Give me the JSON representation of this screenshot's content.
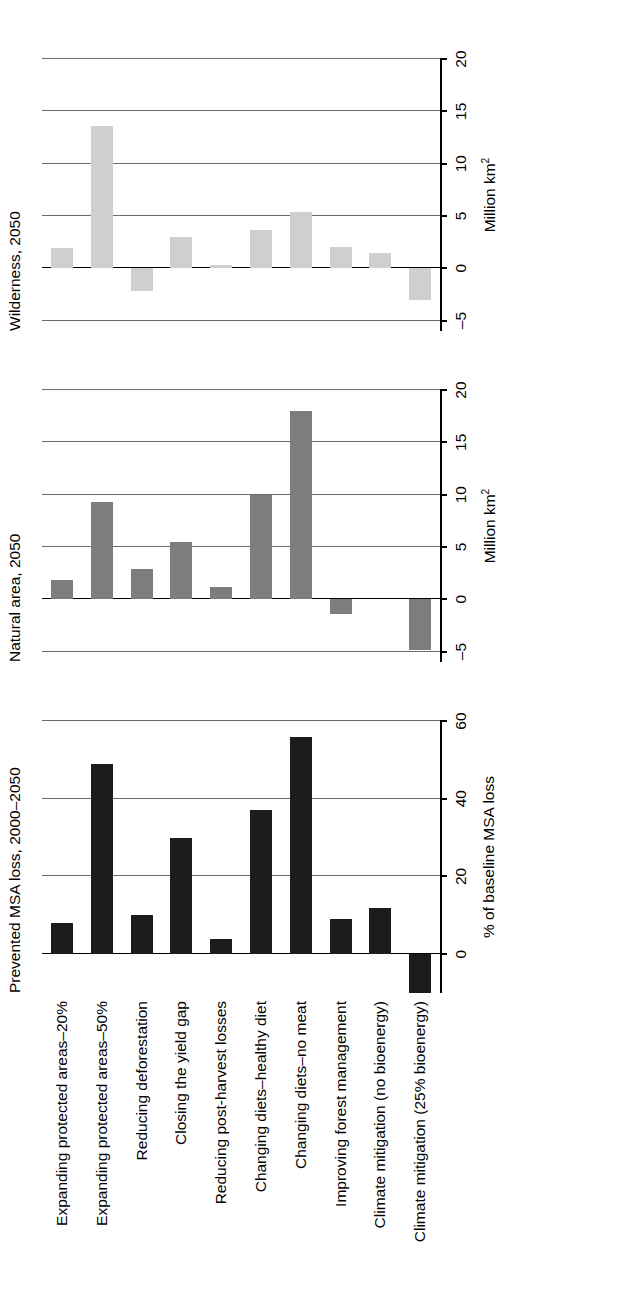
{
  "figure": {
    "categories": [
      "Expanding protected areas–20%",
      "Expanding protected areas–50%",
      "Reducing deforestation",
      "Closing the yield gap",
      "Reducing post-harvest losses",
      "Changing diets–healthy diet",
      "Changing diets–no meat",
      "Improving forest management",
      "Climate mitigation (no bioenergy)",
      "Climate mitigation (25% bioenergy)"
    ],
    "panels": [
      {
        "id": "prevented-msa-loss",
        "title": "Prevented MSA loss, 2000–2050",
        "axis_title": "% of baseline MSA loss",
        "axis_title_html": "% of baseline MSA loss",
        "ticks": [
          "0",
          "20",
          "40",
          "60"
        ],
        "tick_values": [
          0,
          20,
          40,
          60
        ],
        "axis_min": -10,
        "axis_max": 60,
        "bar_color": "#1c1c1c",
        "values": [
          8,
          49,
          10,
          30,
          4,
          37,
          56,
          9,
          12,
          -10
        ]
      },
      {
        "id": "natural-area",
        "title": "Natural area, 2050",
        "axis_title": "Million km2",
        "ticks": [
          "–5",
          "0",
          "5",
          "10",
          "15",
          "20"
        ],
        "tick_values": [
          -5,
          0,
          5,
          10,
          15,
          20
        ],
        "axis_min": -6,
        "axis_max": 20,
        "bar_color": "#7d7d7d",
        "values": [
          1.8,
          9.3,
          2.9,
          5.5,
          1.2,
          10.0,
          18.0,
          -1.4,
          0,
          -4.9
        ]
      },
      {
        "id": "wilderness",
        "title": "Wilderness, 2050",
        "axis_title": "Million km2",
        "ticks": [
          "–5",
          "0",
          "5",
          "10",
          "15",
          "20"
        ],
        "tick_values": [
          -5,
          0,
          5,
          10,
          15,
          20
        ],
        "axis_min": -6,
        "axis_max": 20,
        "bar_color": "#cfcfcf",
        "values": [
          1.9,
          13.6,
          -2.2,
          3.0,
          0.3,
          3.7,
          5.4,
          2.0,
          1.5,
          -3.0
        ]
      }
    ]
  },
  "chart_data": {
    "type": "bar",
    "orientation": "vertical-panels-rotated",
    "categories": [
      "Expanding protected areas–20%",
      "Expanding protected areas–50%",
      "Reducing deforestation",
      "Closing the yield gap",
      "Reducing post-harvest losses",
      "Changing diets–healthy diet",
      "Changing diets–no meat",
      "Improving forest management",
      "Climate mitigation (no bioenergy)",
      "Climate mitigation (25% bioenergy)"
    ],
    "panels": [
      {
        "name": "Prevented MSA loss, 2000–2050",
        "ylabel": "% of baseline MSA loss",
        "ylim": [
          -10,
          60
        ],
        "yticks": [
          0,
          20,
          40,
          60
        ],
        "values": [
          8,
          49,
          10,
          30,
          4,
          37,
          56,
          9,
          12,
          -10
        ],
        "color": "#1c1c1c"
      },
      {
        "name": "Natural area, 2050",
        "ylabel": "Million km2",
        "ylim": [
          -6,
          20
        ],
        "yticks": [
          -5,
          0,
          5,
          10,
          15,
          20
        ],
        "values": [
          1.8,
          9.3,
          2.9,
          5.5,
          1.2,
          10.0,
          18.0,
          -1.4,
          0,
          -4.9
        ],
        "color": "#7d7d7d"
      },
      {
        "name": "Wilderness, 2050",
        "ylabel": "Million km2",
        "ylim": [
          -6,
          20
        ],
        "yticks": [
          -5,
          0,
          5,
          10,
          15,
          20
        ],
        "values": [
          1.9,
          13.6,
          -2.2,
          3.0,
          0.3,
          3.7,
          5.4,
          2.0,
          1.5,
          -3.0
        ],
        "color": "#cfcfcf"
      }
    ],
    "grid": true,
    "legend": "none"
  }
}
